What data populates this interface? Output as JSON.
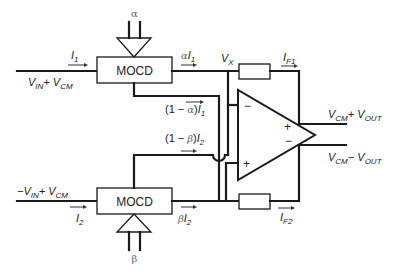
{
  "diagram": {
    "title": "",
    "blocks": {
      "mocd_top": {
        "label": "MOCD",
        "control": "α"
      },
      "mocd_bottom": {
        "label": "MOCD",
        "control": "β"
      },
      "opamp": {
        "minus_top": "−",
        "plus_top": "+",
        "plus_out": "+",
        "minus_out": "−"
      }
    },
    "labels": {
      "i1": {
        "main": "I",
        "sub": "1"
      },
      "i2": {
        "main": "I",
        "sub": "2"
      },
      "vin_top": {
        "p1": "V",
        "s1": "IN",
        "p2": "+ V",
        "s2": "CM"
      },
      "vin_bottom": {
        "p1": "−V",
        "s1": "IN",
        "p2": "+ V",
        "s2": "CM"
      },
      "alpha_i1": {
        "greek": "α",
        "main": "I",
        "sub": "1"
      },
      "beta_i2": {
        "greek": "β",
        "main": "I",
        "sub": "2"
      },
      "one_minus_alpha": {
        "pre": "(1 − ",
        "greek": "α",
        "post": ")",
        "main": "I",
        "sub": "1"
      },
      "one_minus_beta": {
        "pre": "(1 − ",
        "greek": "β",
        "post": ")",
        "main": "I",
        "sub": "2"
      },
      "vx": {
        "main": "V",
        "sub": "X"
      },
      "if1": {
        "main": "I",
        "sub": "F1"
      },
      "if2": {
        "main": "I",
        "sub": "F2"
      },
      "out_pos": {
        "p1": "V",
        "s1": "CM",
        "p2": "+ V",
        "s2": "OUT"
      },
      "out_neg": {
        "p1": "V",
        "s1": "CM",
        "p2": "− V",
        "s2": "OUT"
      }
    }
  }
}
